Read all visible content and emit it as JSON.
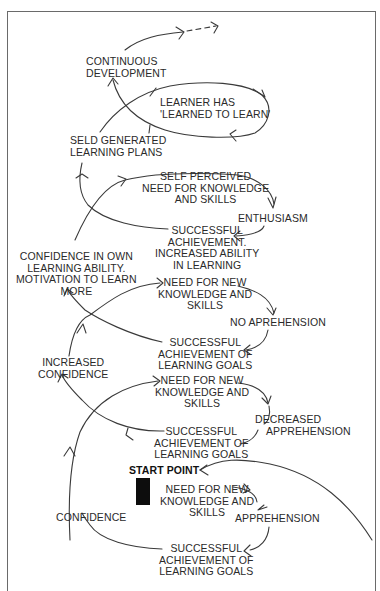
{
  "diagram": {
    "type": "spiral-process-diagram",
    "start_marker_label": "START POINT",
    "loops": [
      {
        "id": "loop-1",
        "nodes": [
          {
            "id": "need-1",
            "lines": [
              "NEED FOR NEW",
              "KNOWLEDGE AND",
              "SKILLS"
            ]
          },
          {
            "id": "apprehension",
            "lines": [
              "APPREHENSION"
            ]
          },
          {
            "id": "success-1",
            "lines": [
              "SUCCESSFUL",
              "ACHIEVEMENT OF",
              "LEARNING GOALS"
            ]
          },
          {
            "id": "confidence",
            "lines": [
              "CONFIDENCE"
            ]
          }
        ]
      },
      {
        "id": "loop-2",
        "nodes": [
          {
            "id": "need-2",
            "lines": [
              "NEED FOR NEW",
              "KNOWLEDGE AND",
              "SKILLS"
            ]
          },
          {
            "id": "decreased-apprehension",
            "lines": [
              "DECREASED",
              "APPREHENSION"
            ]
          },
          {
            "id": "success-2",
            "lines": [
              "SUCCESSFUL",
              "ACHIEVEMENT OF",
              "LEARNING GOALS"
            ]
          },
          {
            "id": "increased-confidence",
            "lines": [
              "INCREASED",
              "CONFIDENCE"
            ]
          }
        ]
      },
      {
        "id": "loop-3",
        "nodes": [
          {
            "id": "need-3",
            "lines": [
              "NEED FOR NEW",
              "KNOWLEDGE AND",
              "SKILLS"
            ]
          },
          {
            "id": "no-apprehension",
            "lines": [
              "NO APREHENSION"
            ]
          },
          {
            "id": "success-3",
            "lines": [
              "SUCCESSFUL",
              "ACHIEVEMENT OF",
              "LEARNING GOALS"
            ]
          },
          {
            "id": "confidence-own",
            "lines": [
              "CONFIDENCE IN OWN",
              "LEARNING ABILITY.",
              "MOTIVATION TO LEARN",
              "MORE"
            ]
          }
        ]
      },
      {
        "id": "loop-4",
        "nodes": [
          {
            "id": "self-perceived",
            "lines": [
              "SELF PERCEIVED",
              "NEED FOR KNOWLEDGE",
              "AND SKILLS"
            ]
          },
          {
            "id": "enthusiasm",
            "lines": [
              "ENTHUSIASM"
            ]
          },
          {
            "id": "success-4",
            "lines": [
              "SUCCESSFUL",
              "ACHIEVEMENT.",
              "INCREASED ABILITY",
              "IN LEARNING"
            ]
          },
          {
            "id": "self-generated",
            "lines": [
              "SELD GENERATED",
              "LEARNING PLANS"
            ]
          }
        ]
      },
      {
        "id": "loop-5",
        "nodes": [
          {
            "id": "learned-to-learn",
            "lines": [
              "LEARNER HAS",
              "'LEARNED TO LEARN'"
            ]
          },
          {
            "id": "continuous",
            "lines": [
              "CONTINUOUS",
              "DEVELOPMENT"
            ]
          }
        ]
      }
    ]
  },
  "colors": {
    "line": "#3a3a3a",
    "text": "#2a2a2a",
    "frame": "#6a6a6a",
    "marker": "#0d0d0d"
  }
}
